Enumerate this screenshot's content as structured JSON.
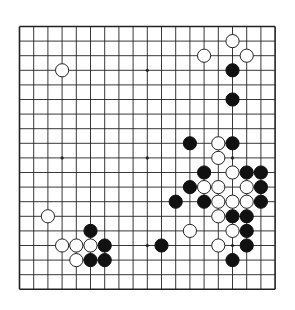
{
  "board": {
    "size": 19,
    "origin_x": 19.5,
    "origin_y": 26.5,
    "step_x": 14.2,
    "step_y": 14.6,
    "line_color": "#222222",
    "background": "#ffffff",
    "stone_radius": 6.6,
    "colors": {
      "black": "#111111",
      "white": "#ffffff",
      "white_edge": "#222222"
    },
    "star_points": [
      [
        3,
        3
      ],
      [
        9,
        3
      ],
      [
        15,
        3
      ],
      [
        3,
        9
      ],
      [
        9,
        9
      ],
      [
        15,
        9
      ],
      [
        3,
        15
      ],
      [
        9,
        15
      ],
      [
        15,
        15
      ]
    ],
    "hidden_star_points_note": "",
    "stones": [
      {
        "c": "W",
        "x": 15,
        "y": 1
      },
      {
        "c": "W",
        "x": 13,
        "y": 2
      },
      {
        "c": "W",
        "x": 16,
        "y": 2
      },
      {
        "c": "W",
        "x": 3,
        "y": 3
      },
      {
        "c": "B",
        "x": 15,
        "y": 3
      },
      {
        "c": "B",
        "x": 15,
        "y": 5
      },
      {
        "c": "B",
        "x": 12,
        "y": 8
      },
      {
        "c": "W",
        "x": 14,
        "y": 8
      },
      {
        "c": "B",
        "x": 15,
        "y": 8
      },
      {
        "c": "W",
        "x": 14,
        "y": 9
      },
      {
        "c": "B",
        "x": 13,
        "y": 10
      },
      {
        "c": "W",
        "x": 15,
        "y": 10
      },
      {
        "c": "B",
        "x": 16,
        "y": 10
      },
      {
        "c": "B",
        "x": 17,
        "y": 10
      },
      {
        "c": "B",
        "x": 12,
        "y": 11
      },
      {
        "c": "W",
        "x": 13,
        "y": 11
      },
      {
        "c": "W",
        "x": 14,
        "y": 11
      },
      {
        "c": "W",
        "x": 16,
        "y": 11
      },
      {
        "c": "B",
        "x": 17,
        "y": 11
      },
      {
        "c": "B",
        "x": 11,
        "y": 12
      },
      {
        "c": "B",
        "x": 13,
        "y": 12
      },
      {
        "c": "W",
        "x": 14,
        "y": 12
      },
      {
        "c": "W",
        "x": 15,
        "y": 12
      },
      {
        "c": "W",
        "x": 16,
        "y": 12
      },
      {
        "c": "B",
        "x": 17,
        "y": 12
      },
      {
        "c": "W",
        "x": 2,
        "y": 13
      },
      {
        "c": "W",
        "x": 14,
        "y": 13
      },
      {
        "c": "B",
        "x": 15,
        "y": 13
      },
      {
        "c": "B",
        "x": 16,
        "y": 13
      },
      {
        "c": "B",
        "x": 5,
        "y": 14
      },
      {
        "c": "W",
        "x": 12,
        "y": 14
      },
      {
        "c": "W",
        "x": 15,
        "y": 14
      },
      {
        "c": "B",
        "x": 16,
        "y": 14
      },
      {
        "c": "W",
        "x": 3,
        "y": 15
      },
      {
        "c": "W",
        "x": 4,
        "y": 15
      },
      {
        "c": "W",
        "x": 5,
        "y": 15
      },
      {
        "c": "B",
        "x": 6,
        "y": 15
      },
      {
        "c": "B",
        "x": 10,
        "y": 15
      },
      {
        "c": "W",
        "x": 14,
        "y": 15
      },
      {
        "c": "B",
        "x": 16,
        "y": 15
      },
      {
        "c": "W",
        "x": 4,
        "y": 16
      },
      {
        "c": "B",
        "x": 5,
        "y": 16
      },
      {
        "c": "B",
        "x": 6,
        "y": 16
      },
      {
        "c": "B",
        "x": 15,
        "y": 16
      }
    ]
  }
}
